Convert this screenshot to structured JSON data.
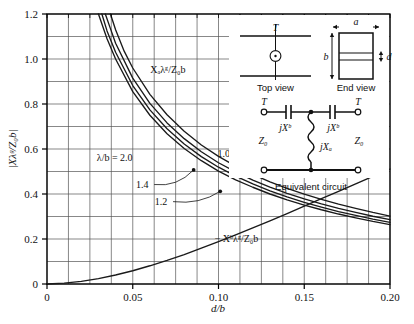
{
  "chart_data": {
    "type": "line",
    "title": "",
    "xlabel": "d/b",
    "ylabel": "|Xλ_g/Z_0 b|",
    "xlim": [
      0,
      0.2
    ],
    "ylim": [
      0,
      1.2
    ],
    "grid": true,
    "x_ticks": [
      0,
      0.05,
      0.1,
      0.15,
      0.2
    ],
    "x_tick_labels": [
      "0",
      "0.05",
      "0.10",
      "0.15",
      "0.20"
    ],
    "y_ticks": [
      0,
      0.2,
      0.4,
      0.6,
      0.8,
      1.0,
      1.2
    ],
    "y_tick_labels": [
      "0",
      "0.2",
      "0.4",
      "0.6",
      "0.8",
      "1.0",
      "1.2"
    ],
    "x_minor_step": 0.0125,
    "y_minor_step": 0.1,
    "legend_position": "inline-annotations",
    "series": [
      {
        "name": "Xaλg/Z0b, λ/b = 2.0",
        "label": "2.0",
        "x": [
          0.03,
          0.035,
          0.04,
          0.05,
          0.06,
          0.07,
          0.08,
          0.09,
          0.1,
          0.11,
          0.12,
          0.13,
          0.14,
          0.15,
          0.16,
          0.17,
          0.18,
          0.19,
          0.2
        ],
        "y": [
          1.2,
          1.09,
          1.0,
          0.855,
          0.75,
          0.668,
          0.602,
          0.548,
          0.502,
          0.463,
          0.43,
          0.4,
          0.374,
          0.351,
          0.33,
          0.311,
          0.294,
          0.278,
          0.264
        ]
      },
      {
        "name": "Xaλg/Z0b, λ/b = 1.4",
        "label": "1.4",
        "x": [
          0.032,
          0.035,
          0.04,
          0.05,
          0.06,
          0.07,
          0.08,
          0.09,
          0.1,
          0.11,
          0.12,
          0.13,
          0.14,
          0.15,
          0.16,
          0.17,
          0.18,
          0.19,
          0.2
        ],
        "y": [
          1.2,
          1.125,
          1.03,
          0.882,
          0.774,
          0.69,
          0.622,
          0.566,
          0.519,
          0.479,
          0.445,
          0.414,
          0.387,
          0.363,
          0.342,
          0.322,
          0.305,
          0.288,
          0.274
        ]
      },
      {
        "name": "Xaλg/Z0b, λ/b = 1.2",
        "label": "1.2",
        "x": [
          0.034,
          0.037,
          0.04,
          0.05,
          0.06,
          0.07,
          0.08,
          0.09,
          0.1,
          0.11,
          0.12,
          0.13,
          0.14,
          0.15,
          0.16,
          0.17,
          0.18,
          0.19,
          0.2
        ],
        "y": [
          1.2,
          1.135,
          1.07,
          0.915,
          0.803,
          0.716,
          0.646,
          0.588,
          0.539,
          0.498,
          0.462,
          0.431,
          0.403,
          0.378,
          0.356,
          0.336,
          0.318,
          0.301,
          0.286
        ]
      },
      {
        "name": "Xaλg/Z0b, λ/b = 1.0",
        "label": "1.0",
        "x": [
          0.037,
          0.04,
          0.045,
          0.05,
          0.06,
          0.07,
          0.08,
          0.09,
          0.1,
          0.11,
          0.12,
          0.13,
          0.14,
          0.15,
          0.16,
          0.17,
          0.18,
          0.19,
          0.2
        ],
        "y": [
          1.2,
          1.13,
          1.035,
          0.96,
          0.843,
          0.752,
          0.679,
          0.618,
          0.567,
          0.524,
          0.487,
          0.454,
          0.425,
          0.399,
          0.376,
          0.355,
          0.336,
          0.318,
          0.302
        ]
      },
      {
        "name": "-Xbλg/Z0b",
        "label": "− X_bλ_g/Z_0 b",
        "x": [
          0.0,
          0.01,
          0.02,
          0.03,
          0.04,
          0.05,
          0.06,
          0.07,
          0.08,
          0.09,
          0.1,
          0.11,
          0.12,
          0.13,
          0.14,
          0.15,
          0.16,
          0.17,
          0.18,
          0.19,
          0.2
        ],
        "y": [
          0.0,
          0.004,
          0.012,
          0.024,
          0.04,
          0.059,
          0.081,
          0.105,
          0.131,
          0.159,
          0.188,
          0.218,
          0.249,
          0.281,
          0.313,
          0.346,
          0.379,
          0.412,
          0.445,
          0.478,
          0.511
        ]
      }
    ],
    "annotations": [
      {
        "name": "upper-family-label",
        "text": "Xₐλᵍ/Z₀b",
        "x": 0.0705,
        "y": 0.955
      },
      {
        "name": "lower-curve-label",
        "text": "− Xᵇλᵍ/Z₀b",
        "x": 0.1105,
        "y": 0.205
      },
      {
        "name": "lambda-b-label",
        "text": "λ/b = 2.0",
        "x": 0.0395,
        "y": 0.565
      },
      {
        "name": "label-1p4",
        "text": "1.4",
        "x": 0.0555,
        "y": 0.445
      },
      {
        "name": "label-1p2",
        "text": "1.2",
        "x": 0.0665,
        "y": 0.368
      },
      {
        "name": "label-1p0",
        "text": "1.0",
        "x": 0.103,
        "y": 0.582
      }
    ]
  },
  "axes": {
    "x_title": "d/b",
    "y_title": "|Xλᵍ/Z₀b|"
  },
  "inset": {
    "top_view": {
      "caption": "Top view",
      "terminal_label": "T"
    },
    "end_view": {
      "caption": "End view",
      "dim_a": "a",
      "dim_b": "b",
      "dim_d": "d"
    },
    "equivalent_circuit": {
      "caption": "Equivalent circuit",
      "terminal_left": "T",
      "terminal_right": "T",
      "z_left": "Z₀",
      "z_right": "Z₀",
      "series_left": "jXᵇ",
      "series_right": "jXᵇ",
      "shunt": "jXₐ"
    }
  },
  "colors": {
    "curve": "#1a1a1a",
    "grid": "#555555",
    "frame": "#000000",
    "background": "#ffffff"
  }
}
